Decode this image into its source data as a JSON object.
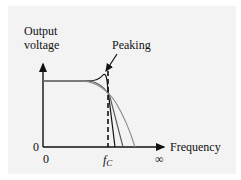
{
  "diagram": {
    "y_axis_label_line1": "Output",
    "y_axis_label_line2": "voltage",
    "x_axis_label": "Frequency",
    "y_origin_label": "0",
    "x_origin_label": "0",
    "cutoff_label_main": "f",
    "cutoff_label_sub": "C",
    "x_end_label": "∞",
    "annotation": "Peaking",
    "colors": {
      "background": "#f3f3f3",
      "axis": "#111111",
      "curve": "#8a8a8a"
    }
  }
}
